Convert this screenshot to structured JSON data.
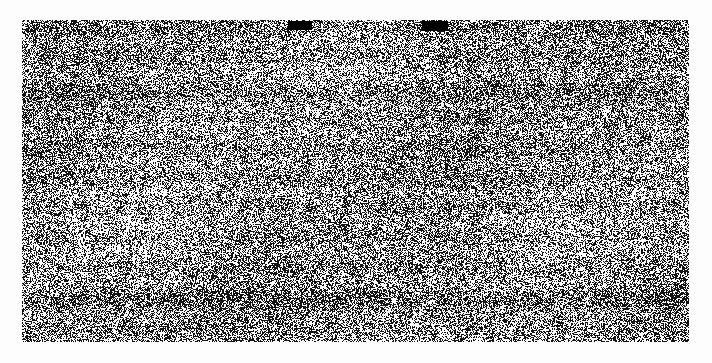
{
  "page": {
    "width": 712,
    "height": 363,
    "background_color": "#fdfdfd",
    "content_legibility": "illegible",
    "alt_text": "Heavily degraded scanned page: dense random black-and-white dither covering the page body with two solid black bars along the top edge"
  },
  "scan": {
    "name": "scanned-page-body",
    "x": 22,
    "y": 20,
    "width": 667,
    "height": 322,
    "ink_color": "#141414",
    "paper_color": "#ffffff",
    "dither_type": "random-binary-noise",
    "black_density_percent": 47,
    "pixel_cell_size": 1,
    "banding_rows": [
      95,
      300
    ],
    "caption": ""
  },
  "redactions": [
    {
      "name": "redaction-bar-1",
      "x": 266,
      "y": 1,
      "width": 24,
      "height": 9,
      "color": "#000000",
      "label": ""
    },
    {
      "name": "redaction-bar-2",
      "x": 400,
      "y": 1,
      "width": 26,
      "height": 10,
      "color": "#000000",
      "label": ""
    }
  ],
  "text_layer": {
    "recognized_text": "",
    "note": "No legible text is present in the rendered pixels"
  }
}
